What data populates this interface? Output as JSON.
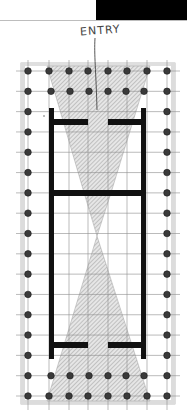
{
  "diagram": {
    "type": "architectural-floor-plan",
    "annotation": "ENTRY",
    "colors": {
      "background": "#ffffff",
      "header_bar": "#000000",
      "wall": "#111111",
      "column": "#3a3a3a",
      "column_outline": "#1a1a1a",
      "grid": "#8a8a8a",
      "platform": "#b5b5b5",
      "hatch": "#9a9a9a",
      "hatch_fill": "#e4e4e4"
    },
    "colonnade": {
      "columns_across": 8,
      "columns_along": 17,
      "x_positions": [
        28,
        49,
        69,
        88,
        108,
        127,
        147,
        167
      ],
      "inner_row_x_positions": [
        51,
        70,
        89,
        108,
        126,
        144
      ],
      "y_top": 71,
      "y_bottom": 396
    },
    "cella": {
      "left_wall_x": 51,
      "right_wall_x": 143,
      "top_y": 108,
      "bottom_y": 359,
      "front_crosswall_y": 122,
      "middle_crosswall_y": 193,
      "rear_crosswall_y": 345,
      "door_gap": [
        88,
        108
      ]
    }
  }
}
